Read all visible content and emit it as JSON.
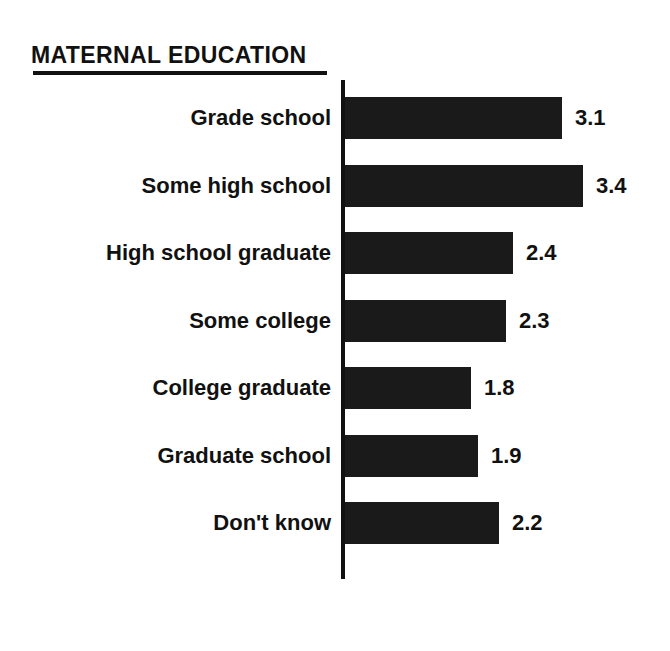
{
  "chart_data": {
    "type": "bar",
    "orientation": "horizontal",
    "title": "MATERNAL EDUCATION",
    "xlabel": "",
    "ylabel": "",
    "categories": [
      "Grade school",
      "Some high school",
      "High school graduate",
      "Some college",
      "College graduate",
      "Graduate school",
      "Don't know"
    ],
    "values": [
      3.1,
      3.4,
      2.4,
      2.3,
      1.8,
      1.9,
      2.2
    ],
    "value_labels": [
      "3.1",
      "3.4",
      "2.4",
      "2.3",
      "1.8",
      "1.9",
      "2.2"
    ],
    "xlim": [
      0,
      3.4
    ],
    "grid": false,
    "legend": null,
    "axis_ticks": [],
    "bar_color": "#1a1a1a",
    "background_color": "#ffffff",
    "text_color": "#111111"
  },
  "bars": [
    {
      "label": "Grade school",
      "value": 3.1,
      "value_text": "3.1"
    },
    {
      "label": "Some high school",
      "value": 3.4,
      "value_text": "3.4"
    },
    {
      "label": "High school graduate",
      "value": 2.4,
      "value_text": "2.4"
    },
    {
      "label": "Some college",
      "value": 2.3,
      "value_text": "2.3"
    },
    {
      "label": "College graduate",
      "value": 1.8,
      "value_text": "1.8"
    },
    {
      "label": "Graduate school",
      "value": 1.9,
      "value_text": "1.9"
    },
    {
      "label": "Don't know",
      "value": 2.2,
      "value_text": "2.2"
    }
  ],
  "layout": {
    "bar_origin_x": 345,
    "first_row_top": 97,
    "row_pitch": 67.5,
    "bar_height": 42,
    "px_per_unit": 70,
    "value_gap": 13
  }
}
